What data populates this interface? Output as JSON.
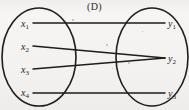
{
  "figure": {
    "caption": "(D)",
    "width": 189,
    "height": 110,
    "background_color": "#f4f3f1",
    "ink_color": "#1d1d1d"
  },
  "domain_set": {
    "name": "left-oval",
    "shape": "ellipse",
    "cx": 39,
    "cy": 57,
    "rx": 37,
    "ry": 49,
    "nodes": [
      {
        "id": "x1",
        "label": "x",
        "sub": "1",
        "x": 25,
        "y": 23,
        "edge_x": 33
      },
      {
        "id": "x2",
        "label": "x",
        "sub": "2",
        "x": 25,
        "y": 46,
        "edge_x": 33
      },
      {
        "id": "x3",
        "label": "x",
        "sub": "3",
        "x": 25,
        "y": 69,
        "edge_x": 33
      },
      {
        "id": "x4",
        "label": "x",
        "sub": "4",
        "x": 25,
        "y": 92,
        "edge_x": 33
      }
    ]
  },
  "codomain_set": {
    "name": "right-oval",
    "shape": "ellipse",
    "cx": 152,
    "cy": 57,
    "rx": 36,
    "ry": 49,
    "nodes": [
      {
        "id": "y1",
        "label": "y",
        "sub": "1",
        "x": 172,
        "y": 23,
        "edge_x": 165
      },
      {
        "id": "y2",
        "label": "y",
        "sub": "2",
        "x": 172,
        "y": 58,
        "edge_x": 165
      },
      {
        "id": "y3",
        "label": "y",
        "sub": "3",
        "x": 172,
        "y": 93,
        "edge_x": 165
      }
    ]
  },
  "edges": [
    {
      "id": "x1-y1",
      "from": "x1",
      "to": "y1",
      "x1": 33,
      "y1": 23,
      "x2": 165,
      "y2": 23
    },
    {
      "id": "x2-y2",
      "from": "x2",
      "to": "y2",
      "x1": 33,
      "y1": 46,
      "x2": 165,
      "y2": 58
    },
    {
      "id": "x3-y2",
      "from": "x3",
      "to": "y2",
      "x1": 33,
      "y1": 69,
      "x2": 165,
      "y2": 58
    },
    {
      "id": "x4-y3",
      "from": "x4",
      "to": "y3",
      "x1": 33,
      "y1": 93,
      "x2": 165,
      "y2": 93
    }
  ],
  "specks": [
    {
      "x": 72,
      "y": 19,
      "d": 2
    },
    {
      "x": 106,
      "y": 44,
      "d": 2
    },
    {
      "x": 128,
      "y": 62,
      "d": 2
    },
    {
      "x": 112,
      "y": 68,
      "d": 1
    },
    {
      "x": 58,
      "y": 103,
      "d": 1
    },
    {
      "x": 142,
      "y": 31,
      "d": 1
    }
  ]
}
